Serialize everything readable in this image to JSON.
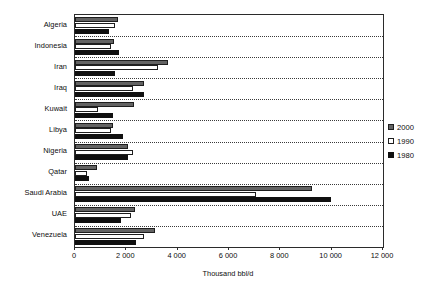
{
  "chart_data": {
    "type": "bar",
    "orientation": "horizontal",
    "title": "",
    "xlabel": "Thousand bbl/d",
    "ylabel": "",
    "xlim": [
      0,
      12000
    ],
    "xticks": [
      0,
      2000,
      4000,
      6000,
      8000,
      10000,
      12000
    ],
    "xtick_labels": [
      "0",
      "2 000",
      "4 000",
      "6 000",
      "8 000",
      "10 000",
      "12 000"
    ],
    "grid": true,
    "grid_style": "dotted horizontal separators between categories",
    "legend_position": "right",
    "categories": [
      "Algeria",
      "Indonesia",
      "Iran",
      "Iraq",
      "Kuwait",
      "Libya",
      "Nigeria",
      "Qatar",
      "Saudi Arabia",
      "UAE",
      "Venezuela"
    ],
    "series": [
      {
        "name": "2000",
        "color": "#636363",
        "values": [
          1670,
          1510,
          3620,
          2690,
          2300,
          1480,
          2060,
          860,
          9230,
          2340,
          3120
        ]
      },
      {
        "name": "1990",
        "color": "#ffffff",
        "values": [
          1550,
          1390,
          3230,
          2260,
          900,
          1420,
          2260,
          470,
          7050,
          2180,
          2690
        ]
      },
      {
        "name": "1980",
        "color": "#101010",
        "values": [
          1320,
          1710,
          1560,
          2690,
          1480,
          1870,
          2060,
          550,
          9980,
          1790,
          2380
        ]
      }
    ],
    "legend_entries": [
      "2000",
      "1990",
      "1980"
    ]
  }
}
